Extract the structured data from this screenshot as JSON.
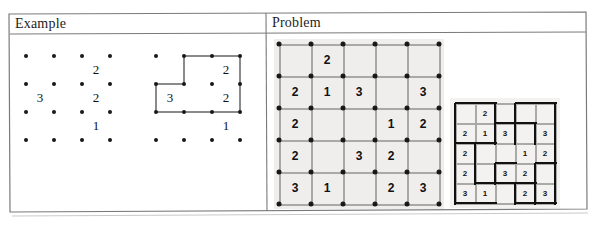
{
  "document": {
    "type": "slitherlink-worksheet-scan",
    "columns": [
      {
        "header": "Example"
      },
      {
        "header": "Problem"
      }
    ]
  },
  "example": {
    "unsolved": {
      "caption": "",
      "rows": 3,
      "cols": 3,
      "clues": [
        {
          "r": 0,
          "c": 2,
          "v": "2"
        },
        {
          "r": 1,
          "c": 0,
          "v": "3"
        },
        {
          "r": 1,
          "c": 2,
          "v": "2"
        },
        {
          "r": 2,
          "c": 2,
          "v": "1"
        }
      ]
    },
    "solved": {
      "caption": "",
      "rows": 3,
      "cols": 3,
      "clues": [
        {
          "r": 0,
          "c": 2,
          "v": "2"
        },
        {
          "r": 1,
          "c": 0,
          "v": "3"
        },
        {
          "r": 1,
          "c": 2,
          "v": "2"
        },
        {
          "r": 2,
          "c": 2,
          "v": "1"
        }
      ],
      "loop_h": [
        {
          "r": 0,
          "c": 1
        },
        {
          "r": 0,
          "c": 2
        },
        {
          "r": 1,
          "c": 0
        },
        {
          "r": 2,
          "c": 0
        },
        {
          "r": 2,
          "c": 1
        },
        {
          "r": 2,
          "c": 2
        }
      ],
      "loop_v": [
        {
          "r": 0,
          "c": 1
        },
        {
          "r": 0,
          "c": 3
        },
        {
          "r": 1,
          "c": 3
        },
        {
          "r": 1,
          "c": 0
        }
      ]
    }
  },
  "problem": {
    "board": {
      "rows": 5,
      "cols": 5,
      "grid": [
        [
          "",
          "2",
          "",
          "",
          ""
        ],
        [
          "2",
          "1",
          "3",
          "",
          "3"
        ],
        [
          "2",
          "",
          "",
          "1",
          "2"
        ],
        [
          "2",
          "",
          "3",
          "2",
          ""
        ],
        [
          "3",
          "1",
          "",
          "2",
          "3"
        ]
      ]
    },
    "solution": {
      "rows": 5,
      "cols": 5,
      "grid": [
        [
          "",
          "2",
          "",
          "",
          ""
        ],
        [
          "2",
          "1",
          "3",
          "",
          "3"
        ],
        [
          "2",
          "",
          "",
          "1",
          "2"
        ],
        [
          "2",
          "",
          "3",
          "2",
          ""
        ],
        [
          "3",
          "1",
          "",
          "2",
          "3"
        ]
      ],
      "loop_h": [
        {
          "r": 0,
          "c": 0
        },
        {
          "r": 0,
          "c": 1
        },
        {
          "r": 0,
          "c": 3
        },
        {
          "r": 0,
          "c": 4
        },
        {
          "r": 1,
          "c": 2
        },
        {
          "r": 1,
          "c": 3
        },
        {
          "r": 2,
          "c": 0
        },
        {
          "r": 2,
          "c": 1
        },
        {
          "r": 3,
          "c": 2
        },
        {
          "r": 3,
          "c": 4
        },
        {
          "r": 4,
          "c": 1
        },
        {
          "r": 4,
          "c": 2
        },
        {
          "r": 4,
          "c": 3
        },
        {
          "r": 5,
          "c": 0
        },
        {
          "r": 5,
          "c": 1
        },
        {
          "r": 5,
          "c": 3
        },
        {
          "r": 5,
          "c": 4
        }
      ],
      "loop_v": [
        {
          "r": 0,
          "c": 0
        },
        {
          "r": 0,
          "c": 2
        },
        {
          "r": 0,
          "c": 3
        },
        {
          "r": 0,
          "c": 5
        },
        {
          "r": 1,
          "c": 0
        },
        {
          "r": 1,
          "c": 2
        },
        {
          "r": 1,
          "c": 3
        },
        {
          "r": 1,
          "c": 4
        },
        {
          "r": 1,
          "c": 5
        },
        {
          "r": 2,
          "c": 0
        },
        {
          "r": 2,
          "c": 1
        },
        {
          "r": 2,
          "c": 5
        },
        {
          "r": 3,
          "c": 0
        },
        {
          "r": 3,
          "c": 1
        },
        {
          "r": 3,
          "c": 2
        },
        {
          "r": 3,
          "c": 4
        },
        {
          "r": 3,
          "c": 5
        },
        {
          "r": 4,
          "c": 0
        },
        {
          "r": 4,
          "c": 3
        },
        {
          "r": 4,
          "c": 4
        },
        {
          "r": 4,
          "c": 5
        }
      ]
    }
  },
  "colors": {
    "paper": "#ffffff",
    "frame": "#7a7a7a",
    "ink": "#111111",
    "board_fill": "#efeeec",
    "gridline": "#a9a9a7",
    "dot": "#181818",
    "loop": "#111111",
    "loop_light": "#8a8a8a"
  }
}
